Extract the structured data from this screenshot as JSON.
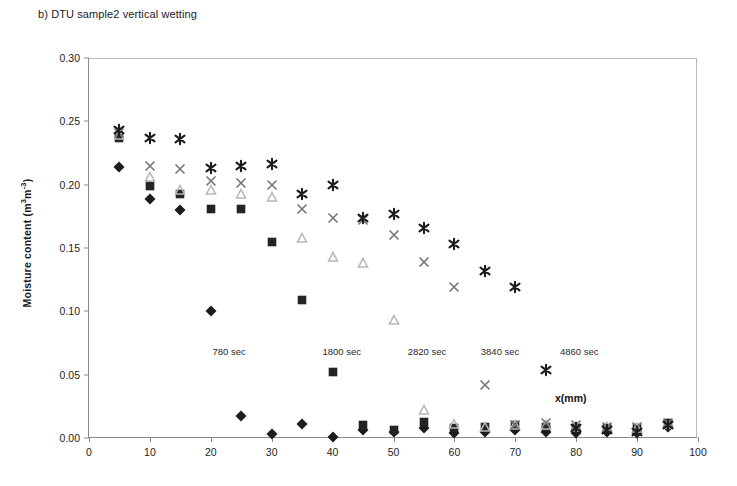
{
  "figure": {
    "caption": "b) DTU sample2 vertical wetting",
    "xlabel_inline": "x(mm)"
  },
  "chart_data": {
    "type": "scatter",
    "title": "b) DTU sample2 vertical wetting",
    "xlabel": "x(mm)",
    "ylabel": "Moisture content (m3 m-3)",
    "xlim": [
      0,
      100
    ],
    "ylim": [
      0.0,
      0.3
    ],
    "xticks": [
      0,
      10,
      20,
      30,
      40,
      50,
      60,
      70,
      80,
      90,
      100
    ],
    "yticks": [
      "0.00",
      "0.05",
      "0.10",
      "0.15",
      "0.20",
      "0.25",
      "0.30"
    ],
    "grid": false,
    "legend": "none",
    "annotations": [
      {
        "text": "780 sec",
        "x": 23,
        "y": 0.073
      },
      {
        "text": "1800 sec",
        "x": 41.5,
        "y": 0.073
      },
      {
        "text": "2820 sec",
        "x": 55.5,
        "y": 0.073
      },
      {
        "text": "3840 sec",
        "x": 67.5,
        "y": 0.073
      },
      {
        "text": "4860 sec",
        "x": 80.5,
        "y": 0.073
      }
    ],
    "series": [
      {
        "name": "780 sec",
        "marker": "diamond",
        "color": "#1c1c1c",
        "x": [
          5,
          10,
          15,
          20,
          25,
          30,
          35,
          40,
          45,
          50,
          55,
          60,
          65,
          70,
          75,
          80,
          85,
          90,
          95
        ],
        "y": [
          0.214,
          0.189,
          0.18,
          0.1,
          0.017,
          0.003,
          0.011,
          0.001,
          0.006,
          0.005,
          0.008,
          0.004,
          0.005,
          0.006,
          0.005,
          0.004,
          0.005,
          0.004,
          0.009
        ]
      },
      {
        "name": "1800 sec",
        "marker": "square",
        "color": "#242424",
        "x": [
          5,
          10,
          15,
          20,
          25,
          30,
          35,
          40,
          45,
          50,
          55,
          60,
          65,
          70,
          75,
          80,
          85,
          90,
          95
        ],
        "y": [
          0.237,
          0.199,
          0.193,
          0.181,
          0.181,
          0.155,
          0.109,
          0.052,
          0.01,
          0.006,
          0.013,
          0.008,
          0.009,
          0.01,
          0.009,
          0.008,
          0.008,
          0.008,
          0.012
        ]
      },
      {
        "name": "2820 sec",
        "marker": "triangle",
        "color": "#b8b8b8",
        "x": [
          5,
          10,
          15,
          20,
          25,
          30,
          35,
          40,
          45,
          50,
          55,
          60,
          65,
          70,
          75,
          80,
          85,
          90,
          95
        ],
        "y": [
          0.239,
          0.206,
          0.196,
          0.196,
          0.193,
          0.19,
          0.158,
          0.143,
          0.138,
          0.093,
          0.022,
          0.011,
          0.009,
          0.01,
          0.01,
          0.009,
          0.009,
          0.008,
          0.011
        ]
      },
      {
        "name": "3840 sec",
        "marker": "cross",
        "color": "#777777",
        "x": [
          5,
          10,
          15,
          20,
          25,
          30,
          35,
          40,
          45,
          50,
          55,
          60,
          65,
          70,
          75,
          80,
          85,
          90,
          95
        ],
        "y": [
          0.241,
          0.215,
          0.212,
          0.203,
          0.201,
          0.2,
          0.181,
          0.174,
          0.172,
          0.16,
          0.139,
          0.119,
          0.042,
          0.01,
          0.012,
          0.01,
          0.009,
          0.009,
          0.012
        ]
      },
      {
        "name": "4860 sec",
        "marker": "asterisk",
        "color": "#1c1c1c",
        "x": [
          5,
          10,
          15,
          20,
          25,
          30,
          35,
          40,
          45,
          50,
          55,
          60,
          65,
          70,
          75,
          80,
          85,
          90,
          95
        ],
        "y": [
          0.243,
          0.237,
          0.236,
          0.213,
          0.215,
          0.216,
          0.193,
          0.2,
          0.174,
          0.177,
          0.166,
          0.153,
          0.132,
          0.119,
          0.054,
          0.008,
          0.006,
          0.005,
          0.01
        ]
      }
    ]
  }
}
